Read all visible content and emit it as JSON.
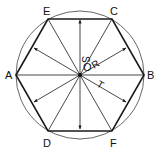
{
  "diagram": {
    "center_label": "O",
    "vertices": [
      {
        "label": "A",
        "x": 16,
        "y": 75
      },
      {
        "label": "E",
        "x": 48,
        "y": 19
      },
      {
        "label": "C",
        "x": 112,
        "y": 19
      },
      {
        "label": "B",
        "x": 144,
        "y": 75
      },
      {
        "label": "F",
        "x": 112,
        "y": 131
      },
      {
        "label": "D",
        "x": 48,
        "y": 131
      }
    ],
    "dimension_labels": {
      "s": "S",
      "r": "R",
      "t": "T"
    },
    "colors": {
      "line": "#1a1a1a",
      "circle": "#555555",
      "background": "#ffffff"
    }
  }
}
